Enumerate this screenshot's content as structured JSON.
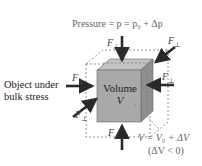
{
  "diagram": {
    "title_equation": "Pressure = p = p₀ + Δp",
    "object_label_line1": "Object under",
    "object_label_line2": "bulk stress",
    "cube_label_line1": "Volume",
    "cube_label_line2": "V",
    "force_label": "F",
    "force_subscript": "⊥",
    "volume_equation": "V = V₀ + ΔV",
    "volume_condition": "(ΔV < 0)",
    "colors": {
      "cube_front": "#a9a9a9",
      "cube_top": "#c2c2c2",
      "cube_side": "#8f8f8f",
      "arrow": "#2a2a2a",
      "dashed_outline": "#777777"
    }
  }
}
